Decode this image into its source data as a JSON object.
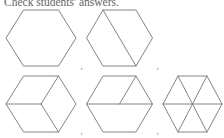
{
  "heading": {
    "text": "Check students' answers."
  },
  "separators": {
    "comma": ",",
    "positions": [
      {
        "x": 80.5,
        "y": 68.5
      },
      {
        "x": 156.5,
        "y": 68.5
      },
      {
        "x": 80.5,
        "y": 134.0
      },
      {
        "x": 156.5,
        "y": 134.0
      }
    ]
  },
  "style": {
    "stroke_color": "#767679",
    "heading_color": "#56565a",
    "background": "#ffffff",
    "stroke_width": 0.9
  },
  "figures": {
    "caption_label": "Five hexagons showing different ways to partition a regular hexagon",
    "items": [
      {
        "name": "hexagon-1-whole",
        "label": "whole hexagon",
        "center": {
          "cx": 41,
          "cy": 38
        },
        "radius": {
          "rx": 35,
          "ry": 28
        },
        "parts": 1,
        "cuts": []
      },
      {
        "name": "hexagon-2-halves-diagonal",
        "label": "two halves, long diagonal",
        "center": {
          "cx": 119.5,
          "cy": 38
        },
        "radius": {
          "rx": 33,
          "ry": 28
        },
        "parts": 2,
        "cuts": [
          {
            "type": "vertex-to-vertex",
            "from": 1,
            "to": 4
          }
        ]
      },
      {
        "name": "hexagon-3-thirds-cube",
        "label": "three rhombuses",
        "center": {
          "cx": 41,
          "cy": 104
        },
        "radius": {
          "rx": 35,
          "ry": 28
        },
        "parts": 3,
        "cuts": [
          {
            "type": "center-to-vertex",
            "to": 3
          },
          {
            "type": "center-to-vertex",
            "to": 5
          },
          {
            "type": "center-to-vertex",
            "to": 1
          }
        ]
      },
      {
        "name": "hexagon-4-halves-plus-triangles",
        "label": "one half and two quarters",
        "center": {
          "cx": 119.5,
          "cy": 104
        },
        "radius": {
          "rx": 33,
          "ry": 28
        },
        "parts": 3,
        "cuts": [
          {
            "type": "vertex-to-vertex",
            "from": 0,
            "to": 3
          },
          {
            "type": "center-to-vertex",
            "to": 1
          }
        ]
      },
      {
        "name": "hexagon-5-sixths-triangles",
        "label": "six triangles",
        "center": {
          "cx": 192.5,
          "cy": 104
        },
        "radius": {
          "rx": 30,
          "ry": 28
        },
        "parts": 6,
        "cuts": [
          {
            "type": "vertex-to-vertex",
            "from": 0,
            "to": 3
          },
          {
            "type": "vertex-to-vertex",
            "from": 1,
            "to": 4
          },
          {
            "type": "vertex-to-vertex",
            "from": 2,
            "to": 5
          }
        ]
      }
    ]
  }
}
